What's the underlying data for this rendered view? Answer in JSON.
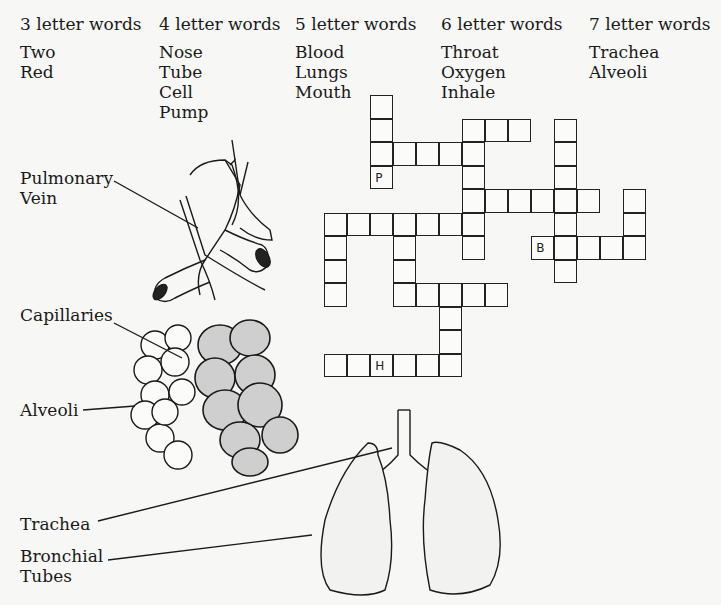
{
  "word_lists": [
    {
      "header": "3 letter words",
      "words": [
        "Two",
        "Red"
      ],
      "x": 20
    },
    {
      "header": "4 letter words",
      "words": [
        "Nose",
        "Tube",
        "Cell",
        "Pump"
      ],
      "x": 159
    },
    {
      "header": "5 letter words",
      "words": [
        "Blood",
        "Lungs",
        "Mouth"
      ],
      "x": 295
    },
    {
      "header": "6 letter words",
      "words": [
        "Throat",
        "Oxygen",
        "Inhale"
      ],
      "x": 441
    },
    {
      "header": "7 letter words",
      "words": [
        "Trachea",
        "Alveoli"
      ],
      "x": 589
    }
  ],
  "crossword": {
    "origin_x": 325,
    "origin_y": 96,
    "cell_w": 23,
    "cell_h": 23.5,
    "cells": [
      [
        2,
        0,
        ""
      ],
      [
        2,
        1,
        ""
      ],
      [
        2,
        2,
        ""
      ],
      [
        2,
        3,
        "P"
      ],
      [
        3,
        2,
        ""
      ],
      [
        4,
        2,
        ""
      ],
      [
        5,
        2,
        ""
      ],
      [
        6,
        2,
        ""
      ],
      [
        6,
        1,
        ""
      ],
      [
        7,
        1,
        ""
      ],
      [
        8,
        1,
        ""
      ],
      [
        6,
        3,
        ""
      ],
      [
        6,
        4,
        ""
      ],
      [
        6,
        5,
        ""
      ],
      [
        6,
        6,
        ""
      ],
      [
        7,
        4,
        ""
      ],
      [
        8,
        4,
        ""
      ],
      [
        9,
        4,
        ""
      ],
      [
        10,
        4,
        ""
      ],
      [
        11,
        4,
        ""
      ],
      [
        10,
        1,
        ""
      ],
      [
        10,
        2,
        ""
      ],
      [
        10,
        3,
        ""
      ],
      [
        10,
        5,
        ""
      ],
      [
        10,
        6,
        ""
      ],
      [
        10,
        7,
        ""
      ],
      [
        0,
        5,
        ""
      ],
      [
        1,
        5,
        ""
      ],
      [
        2,
        5,
        ""
      ],
      [
        3,
        5,
        ""
      ],
      [
        4,
        5,
        ""
      ],
      [
        5,
        5,
        ""
      ],
      [
        0,
        6,
        ""
      ],
      [
        0,
        7,
        ""
      ],
      [
        0,
        8,
        ""
      ],
      [
        3,
        6,
        ""
      ],
      [
        3,
        7,
        ""
      ],
      [
        3,
        8,
        ""
      ],
      [
        4,
        8,
        ""
      ],
      [
        5,
        8,
        ""
      ],
      [
        6,
        8,
        ""
      ],
      [
        7,
        8,
        ""
      ],
      [
        5,
        9,
        ""
      ],
      [
        5,
        10,
        ""
      ],
      [
        5,
        11,
        ""
      ],
      [
        0,
        11,
        ""
      ],
      [
        1,
        11,
        ""
      ],
      [
        2,
        11,
        "H"
      ],
      [
        3,
        11,
        ""
      ],
      [
        4,
        11,
        ""
      ],
      [
        13,
        4,
        ""
      ],
      [
        13,
        5,
        ""
      ],
      [
        13,
        6,
        ""
      ],
      [
        9,
        6,
        "B"
      ],
      [
        11,
        6,
        ""
      ],
      [
        12,
        6,
        ""
      ]
    ]
  },
  "labels": {
    "pulmonary_vein": [
      "Pulmonary",
      "Vein"
    ],
    "capillaries": "Capillaries",
    "alveoli": "Alveoli",
    "trachea": "Trachea",
    "bronchial_tubes": [
      "Bronchial",
      "Tubes"
    ]
  }
}
